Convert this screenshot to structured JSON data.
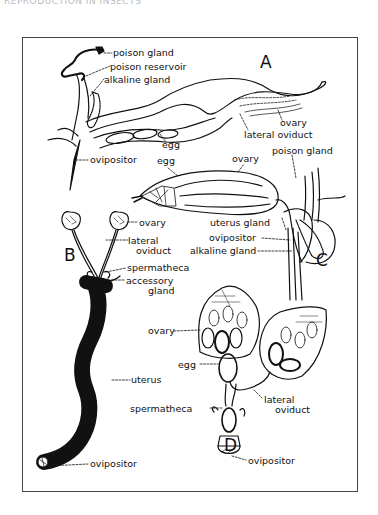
{
  "header": {
    "text": "REPRODUCTION IN INSECTS"
  },
  "panels": {
    "A": {
      "letter": "A",
      "labels": {
        "poison_gland": "poison gland",
        "poison_reservoir": "poison reservoir",
        "alkaline_gland": "alkaline gland",
        "egg": "egg",
        "ovary": "ovary",
        "lateral_oviduct": "lateral oviduct",
        "ovipositor": "ovipositor"
      }
    },
    "B": {
      "letter": "B",
      "labels": {
        "ovary": "ovary",
        "lateral_oviduct_1": "lateral",
        "lateral_oviduct_2": "oviduct",
        "spermatheca": "spermatheca",
        "accessory_gland_1": "accessory",
        "accessory_gland_2": "gland",
        "uterus": "uterus",
        "ovipositor": "ovipositor"
      }
    },
    "C": {
      "letter": "C",
      "labels": {
        "egg": "egg",
        "ovary": "ovary",
        "poison_gland": "poison gland",
        "uterus_gland": "uterus gland",
        "ovipositor": "ovipositor",
        "alkaline_gland": "alkaline gland"
      }
    },
    "D": {
      "letter": "D",
      "labels": {
        "ovary": "ovary",
        "egg": "egg",
        "spermatheca": "spermatheca",
        "lateral_oviduct_1": "lateral",
        "lateral_oviduct_2": "oviduct",
        "ovipositor": "ovipositor"
      }
    }
  },
  "colors": {
    "ink": "#111111",
    "frame": "#444444",
    "background": "#ffffff"
  }
}
